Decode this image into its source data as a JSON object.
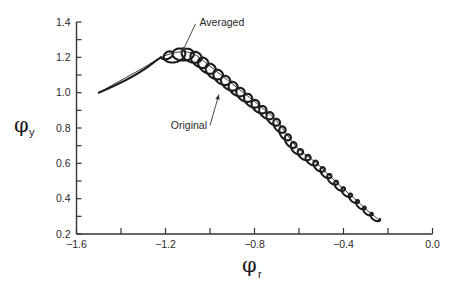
{
  "chart_data": {
    "type": "line",
    "title": "",
    "xlabel": {
      "symbol": "φ",
      "subscript": "r"
    },
    "ylabel": {
      "symbol": "φ",
      "subscript": "y"
    },
    "xlim": [
      -1.6,
      0.0
    ],
    "ylim": [
      0.2,
      1.4
    ],
    "x_ticks": [
      {
        "value": -1.6,
        "label": "-1.6"
      },
      {
        "value": -1.4,
        "label": ""
      },
      {
        "value": -1.2,
        "label": "-1.2"
      },
      {
        "value": -1.0,
        "label": ""
      },
      {
        "value": -0.8,
        "label": "-0.8"
      },
      {
        "value": -0.6,
        "label": ""
      },
      {
        "value": -0.4,
        "label": "-0.4"
      },
      {
        "value": -0.2,
        "label": ""
      },
      {
        "value": 0.0,
        "label": "0.0"
      }
    ],
    "y_ticks": [
      {
        "value": 0.2,
        "label": "0.2"
      },
      {
        "value": 0.3,
        "label": ""
      },
      {
        "value": 0.4,
        "label": "0.4"
      },
      {
        "value": 0.5,
        "label": ""
      },
      {
        "value": 0.6,
        "label": "0.6"
      },
      {
        "value": 0.7,
        "label": ""
      },
      {
        "value": 0.8,
        "label": "0.8"
      },
      {
        "value": 0.9,
        "label": ""
      },
      {
        "value": 1.0,
        "label": "1.0"
      },
      {
        "value": 1.1,
        "label": ""
      },
      {
        "value": 1.2,
        "label": "1.2"
      },
      {
        "value": 1.3,
        "label": ""
      },
      {
        "value": 1.4,
        "label": "1.4"
      }
    ],
    "grid": false,
    "legend": "none",
    "series": [
      {
        "name": "Averaged",
        "style": "thin",
        "x": [
          -1.5,
          -1.4,
          -1.3,
          -1.22,
          -1.16,
          -1.11,
          -1.06,
          -1.01,
          -0.95,
          -0.88,
          -0.8,
          -0.7,
          -0.61,
          -0.52,
          -0.43,
          -0.35,
          -0.29,
          -0.24
        ],
        "y": [
          1.0,
          1.07,
          1.14,
          1.2,
          1.225,
          1.232,
          1.21,
          1.16,
          1.1,
          1.03,
          0.95,
          0.84,
          0.69,
          0.6,
          0.49,
          0.4,
          0.33,
          0.28
        ]
      },
      {
        "name": "Original",
        "style": "thick",
        "description": "oscillating loops about the averaged path, about 30 loops with amplitude decreasing toward the end",
        "loops": 30,
        "amplitude_start": 0.07,
        "amplitude_end": 0.022,
        "start": {
          "x": -1.5,
          "y": 1.0
        },
        "end": {
          "x": -0.24,
          "y": 0.28
        }
      }
    ],
    "annotations": [
      {
        "text": "Averaged",
        "target_x": -1.125,
        "target_y": 1.23,
        "anchor_x": -1.065,
        "anchor_y": 1.39
      },
      {
        "text": "Original",
        "target_x": -0.96,
        "target_y": 0.99,
        "anchor_x": -1.0,
        "anchor_y": 0.815
      }
    ]
  }
}
